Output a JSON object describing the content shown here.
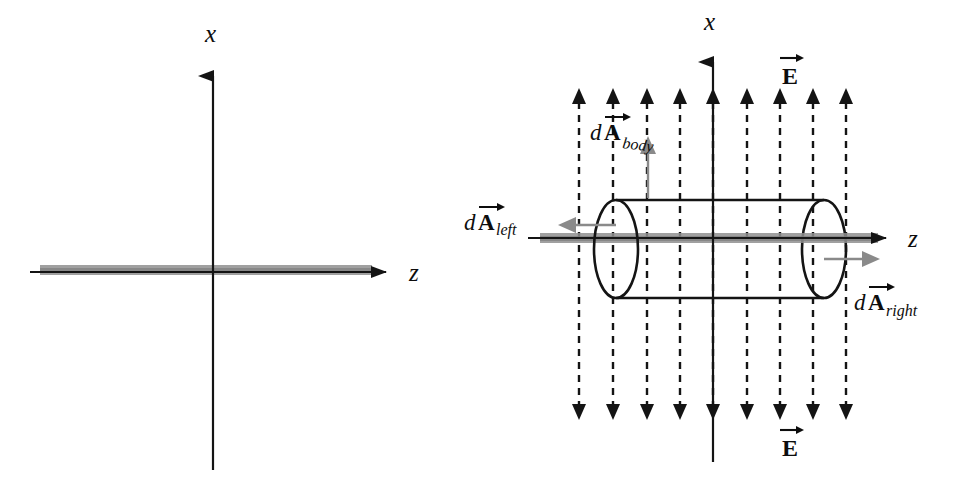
{
  "figure": {
    "background_color": "#ffffff",
    "width": 964,
    "height": 480
  },
  "colors": {
    "line": "#111111",
    "rod_gray": "#8c8c8c",
    "rod_gray_soft": "#9a9a9a",
    "da_arrow_gray": "#8a8a8a",
    "field_line": "#141414"
  },
  "panels": [
    {
      "id": "left-panel",
      "name": "rod-axes-only",
      "axes": {
        "x_label": "x",
        "z_label": "z",
        "origin": {
          "x": 213,
          "y": 273
        },
        "x_axis": {
          "x": 213,
          "top_y": 63,
          "bottom_y": 470,
          "arrow_at": "top"
        },
        "z_axis": {
          "y": 273,
          "left_x": 30,
          "right_x": 398,
          "arrow_at": "right"
        }
      },
      "rod": {
        "name": "charged-rod",
        "x_start": 40,
        "x_end": 372,
        "y": 271,
        "thickness": 9
      }
    },
    {
      "id": "right-panel",
      "name": "gaussian-cylinder-in-field",
      "axes": {
        "x_label": "x",
        "z_label": "z",
        "origin": {
          "x": 713,
          "y": 238
        },
        "x_axis": {
          "x": 713,
          "top_y": 50,
          "bottom_y": 462,
          "arrow_at": "top"
        },
        "z_axis": {
          "y": 238,
          "left_x": 528,
          "right_x": 898,
          "arrow_at": "right"
        }
      },
      "rod": {
        "name": "charged-rod",
        "x_start": 540,
        "x_end": 878,
        "y": 238,
        "thickness": 9
      },
      "cylinder": {
        "name": "gaussian-surface-cylinder",
        "left_cap_cx": 616,
        "right_cap_cx": 824,
        "cap_cy": 249,
        "cap_rx": 22,
        "cap_ry": 49,
        "top_y": 200,
        "bottom_y": 298
      },
      "field_lines": {
        "name": "uniform-electric-field-lines",
        "count": 9,
        "x_positions": [
          579,
          613,
          647,
          680,
          713,
          747,
          780,
          813,
          846
        ],
        "top_y": 88,
        "bottom_y": 420,
        "style": "dashed-double-headed-vertical",
        "direction": "up-and-down"
      },
      "labels": {
        "e_top": {
          "text": "E",
          "vector": true,
          "x": 790,
          "y": 78
        },
        "e_bottom": {
          "text": "E",
          "vector": true,
          "x": 790,
          "y": 450
        },
        "x_axis": {
          "text": "x",
          "x": 706,
          "y": 28
        },
        "z_axis": {
          "text": "z",
          "x": 912,
          "y": 245
        }
      },
      "area_vectors": [
        {
          "name": "dA-body",
          "d_text": "d",
          "a_text": "A",
          "subscript": "body",
          "label_x": 592,
          "label_y": 133,
          "arrow": {
            "from_x": 648,
            "from_y": 198,
            "to_x": 648,
            "to_y": 142,
            "color": "#8a8a8a"
          },
          "direction": "up (radial, out of cylinder body)"
        },
        {
          "name": "dA-left",
          "d_text": "d",
          "a_text": "A",
          "subscript": "left",
          "label_x": 466,
          "label_y": 223,
          "arrow": {
            "from_x": 616,
            "from_y": 225,
            "to_x": 560,
            "to_y": 225,
            "color": "#8a8a8a"
          },
          "direction": "left (outward normal of left cap)"
        },
        {
          "name": "dA-right",
          "d_text": "d",
          "a_text": "A",
          "subscript": "right",
          "label_x": 856,
          "label_y": 305,
          "arrow": {
            "from_x": 824,
            "from_y": 258,
            "to_x": 880,
            "to_y": 258,
            "color": "#8a8a8a"
          },
          "direction": "right (outward normal of right cap)"
        }
      ]
    }
  ]
}
